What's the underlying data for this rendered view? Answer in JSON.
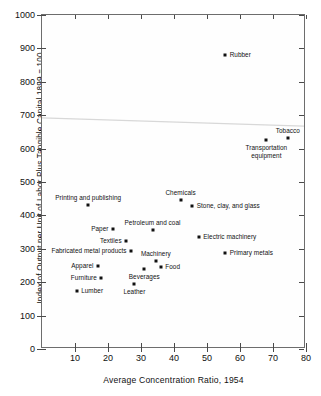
{
  "chart_data": {
    "type": "scatter",
    "title": "",
    "xlabel": "Average Concentration Ratio, 1954",
    "ylabel": "Index of Output per Unit of Labor Plus Tangible Capital 1899 = 100",
    "xlim": [
      0,
      80
    ],
    "ylim": [
      0,
      1000
    ],
    "xticks": [
      10,
      20,
      30,
      40,
      50,
      60,
      70,
      80
    ],
    "yticks": [
      0,
      100,
      200,
      300,
      400,
      500,
      600,
      700,
      800,
      900,
      1000
    ],
    "grid": false,
    "legend": false,
    "marker_color": "#111111",
    "trendline": {
      "present": true,
      "color": "#d8d8d8",
      "y_at_xmin": 690,
      "y_at_xmax": 665
    },
    "points": [
      {
        "label": "Rubber",
        "x": 55.5,
        "y": 880,
        "label_pos": "right"
      },
      {
        "label": "Tobacco",
        "x": 74.5,
        "y": 632,
        "label_pos": "above"
      },
      {
        "label": "Transportation equipment",
        "x": 68.0,
        "y": 625,
        "label_pos": "below"
      },
      {
        "label": "Chemicals",
        "x": 42.0,
        "y": 447,
        "label_pos": "above"
      },
      {
        "label": "Printing and publishing",
        "x": 14.0,
        "y": 432,
        "label_pos": "above"
      },
      {
        "label": "Stone, clay, and glass",
        "x": 45.5,
        "y": 428,
        "label_pos": "right"
      },
      {
        "label": "Paper",
        "x": 21.5,
        "y": 358,
        "label_pos": "left"
      },
      {
        "label": "Petroleum and coal",
        "x": 33.5,
        "y": 355,
        "label_pos": "above"
      },
      {
        "label": "Electric machinery",
        "x": 47.5,
        "y": 334,
        "label_pos": "right"
      },
      {
        "label": "Textiles",
        "x": 25.5,
        "y": 322,
        "label_pos": "left"
      },
      {
        "label": "Fabricated metal products",
        "x": 27.0,
        "y": 294,
        "label_pos": "left"
      },
      {
        "label": "Primary metals",
        "x": 55.5,
        "y": 288,
        "label_pos": "right"
      },
      {
        "label": "Machinery",
        "x": 34.5,
        "y": 263,
        "label_pos": "above"
      },
      {
        "label": "Apparel",
        "x": 17.0,
        "y": 250,
        "label_pos": "left"
      },
      {
        "label": "Food",
        "x": 36.0,
        "y": 247,
        "label_pos": "right"
      },
      {
        "label": "Beverages",
        "x": 31.0,
        "y": 239,
        "label_pos": "below"
      },
      {
        "label": "Furniture",
        "x": 18.0,
        "y": 213,
        "label_pos": "left"
      },
      {
        "label": "Leather",
        "x": 28.0,
        "y": 196,
        "label_pos": "below"
      },
      {
        "label": "Lumber",
        "x": 10.5,
        "y": 174,
        "label_pos": "right"
      }
    ]
  }
}
